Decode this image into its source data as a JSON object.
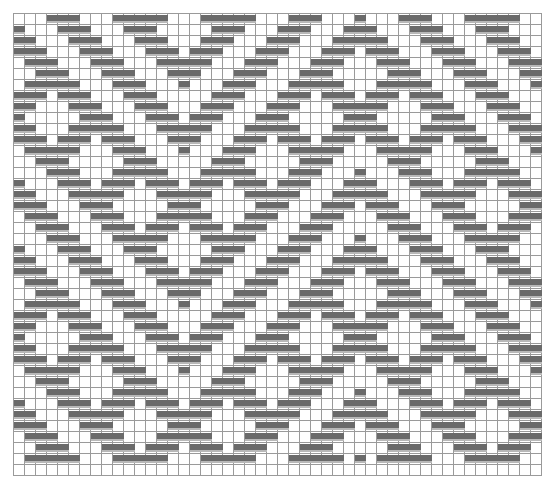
{
  "chart": {
    "type": "weave-pattern-grid",
    "columns": 48,
    "rows": 42,
    "cell_size_px": 11,
    "colors": {
      "filled": "#6a6a6a",
      "empty": "#ffffff",
      "grid_line": "#9a9a9a"
    },
    "filled_runs_by_row": [
      [
        [
          3,
          5
        ],
        [
          9,
          13
        ],
        [
          17,
          21
        ],
        [
          25,
          27
        ],
        [
          31,
          31
        ],
        [
          35,
          37
        ],
        [
          41,
          45
        ]
      ],
      [
        [
          0,
          0
        ],
        [
          4,
          6
        ],
        [
          10,
          12
        ],
        [
          18,
          20
        ],
        [
          24,
          26
        ],
        [
          30,
          32
        ],
        [
          36,
          38
        ],
        [
          42,
          44
        ]
      ],
      [
        [
          0,
          1
        ],
        [
          5,
          7
        ],
        [
          11,
          13
        ],
        [
          17,
          19
        ],
        [
          23,
          25
        ],
        [
          29,
          33
        ],
        [
          37,
          39
        ],
        [
          43,
          45
        ]
      ],
      [
        [
          0,
          2
        ],
        [
          6,
          8
        ],
        [
          12,
          14
        ],
        [
          16,
          18
        ],
        [
          22,
          24
        ],
        [
          28,
          30
        ],
        [
          32,
          34
        ],
        [
          38,
          40
        ],
        [
          44,
          46
        ]
      ],
      [
        [
          1,
          3
        ],
        [
          7,
          9
        ],
        [
          13,
          17
        ],
        [
          21,
          23
        ],
        [
          27,
          29
        ],
        [
          33,
          35
        ],
        [
          39,
          41
        ],
        [
          45,
          47
        ]
      ],
      [
        [
          2,
          4
        ],
        [
          8,
          10
        ],
        [
          14,
          16
        ],
        [
          20,
          22
        ],
        [
          26,
          28
        ],
        [
          34,
          36
        ],
        [
          40,
          42
        ],
        [
          46,
          47
        ]
      ],
      [
        [
          1,
          5
        ],
        [
          9,
          11
        ],
        [
          15,
          15
        ],
        [
          19,
          21
        ],
        [
          25,
          29
        ],
        [
          33,
          37
        ],
        [
          41,
          43
        ],
        [
          47,
          47
        ]
      ],
      [
        [
          0,
          2
        ],
        [
          4,
          6
        ],
        [
          10,
          12
        ],
        [
          18,
          20
        ],
        [
          24,
          26
        ],
        [
          28,
          30
        ],
        [
          32,
          34
        ],
        [
          36,
          38
        ],
        [
          42,
          44
        ]
      ],
      [
        [
          0,
          1
        ],
        [
          5,
          7
        ],
        [
          11,
          13
        ],
        [
          17,
          19
        ],
        [
          23,
          25
        ],
        [
          29,
          33
        ],
        [
          37,
          39
        ],
        [
          43,
          45
        ]
      ],
      [
        [
          0,
          0
        ],
        [
          6,
          8
        ],
        [
          12,
          14
        ],
        [
          16,
          18
        ],
        [
          22,
          24
        ],
        [
          30,
          32
        ],
        [
          38,
          40
        ],
        [
          44,
          46
        ]
      ],
      [
        [
          0,
          1
        ],
        [
          5,
          9
        ],
        [
          13,
          17
        ],
        [
          21,
          25
        ],
        [
          29,
          33
        ],
        [
          37,
          41
        ],
        [
          45,
          47
        ]
      ],
      [
        [
          0,
          2
        ],
        [
          4,
          6
        ],
        [
          8,
          10
        ],
        [
          14,
          16
        ],
        [
          20,
          22
        ],
        [
          24,
          26
        ],
        [
          28,
          30
        ],
        [
          32,
          34
        ],
        [
          36,
          38
        ],
        [
          40,
          42
        ],
        [
          46,
          47
        ]
      ],
      [
        [
          1,
          5
        ],
        [
          9,
          11
        ],
        [
          15,
          15
        ],
        [
          19,
          21
        ],
        [
          25,
          29
        ],
        [
          33,
          37
        ],
        [
          41,
          43
        ],
        [
          47,
          47
        ]
      ],
      [
        [
          2,
          4
        ],
        [
          10,
          12
        ],
        [
          18,
          20
        ],
        [
          26,
          28
        ],
        [
          34,
          36
        ],
        [
          42,
          44
        ]
      ],
      [
        [
          3,
          5
        ],
        [
          9,
          13
        ],
        [
          17,
          21
        ],
        [
          25,
          27
        ],
        [
          31,
          31
        ],
        [
          35,
          37
        ],
        [
          41,
          45
        ]
      ],
      [
        [
          0,
          0
        ],
        [
          4,
          6
        ],
        [
          8,
          10
        ],
        [
          12,
          14
        ],
        [
          16,
          18
        ],
        [
          20,
          22
        ],
        [
          24,
          26
        ],
        [
          30,
          32
        ],
        [
          36,
          38
        ],
        [
          40,
          42
        ],
        [
          44,
          46
        ]
      ],
      [
        [
          0,
          1
        ],
        [
          5,
          9
        ],
        [
          13,
          17
        ],
        [
          21,
          25
        ],
        [
          29,
          33
        ],
        [
          37,
          41
        ],
        [
          45,
          47
        ]
      ],
      [
        [
          0,
          2
        ],
        [
          6,
          8
        ],
        [
          14,
          16
        ],
        [
          22,
          24
        ],
        [
          28,
          30
        ],
        [
          32,
          34
        ],
        [
          38,
          40
        ],
        [
          46,
          47
        ]
      ],
      [
        [
          1,
          3
        ],
        [
          7,
          9
        ],
        [
          13,
          17
        ],
        [
          21,
          23
        ],
        [
          27,
          29
        ],
        [
          33,
          35
        ],
        [
          39,
          41
        ],
        [
          45,
          47
        ]
      ],
      [
        [
          2,
          4
        ],
        [
          8,
          10
        ],
        [
          12,
          14
        ],
        [
          16,
          18
        ],
        [
          20,
          22
        ],
        [
          26,
          28
        ],
        [
          34,
          36
        ],
        [
          40,
          42
        ],
        [
          44,
          46
        ]
      ],
      [
        [
          3,
          5
        ],
        [
          9,
          13
        ],
        [
          17,
          21
        ],
        [
          25,
          27
        ],
        [
          31,
          31
        ],
        [
          35,
          37
        ],
        [
          41,
          45
        ]
      ],
      [
        [
          0,
          0
        ],
        [
          4,
          6
        ],
        [
          10,
          12
        ],
        [
          18,
          20
        ],
        [
          24,
          26
        ],
        [
          30,
          32
        ],
        [
          36,
          38
        ],
        [
          42,
          44
        ]
      ],
      [
        [
          0,
          1
        ],
        [
          5,
          7
        ],
        [
          11,
          13
        ],
        [
          17,
          19
        ],
        [
          23,
          25
        ],
        [
          29,
          33
        ],
        [
          37,
          39
        ],
        [
          43,
          45
        ]
      ],
      [
        [
          0,
          2
        ],
        [
          6,
          8
        ],
        [
          12,
          14
        ],
        [
          16,
          18
        ],
        [
          22,
          24
        ],
        [
          28,
          30
        ],
        [
          32,
          34
        ],
        [
          38,
          40
        ],
        [
          44,
          46
        ]
      ],
      [
        [
          1,
          3
        ],
        [
          7,
          9
        ],
        [
          13,
          17
        ],
        [
          21,
          23
        ],
        [
          27,
          29
        ],
        [
          33,
          35
        ],
        [
          39,
          41
        ],
        [
          45,
          47
        ]
      ],
      [
        [
          2,
          4
        ],
        [
          8,
          10
        ],
        [
          14,
          16
        ],
        [
          20,
          22
        ],
        [
          26,
          28
        ],
        [
          34,
          36
        ],
        [
          40,
          42
        ],
        [
          46,
          47
        ]
      ],
      [
        [
          1,
          5
        ],
        [
          9,
          11
        ],
        [
          15,
          15
        ],
        [
          19,
          21
        ],
        [
          25,
          29
        ],
        [
          33,
          37
        ],
        [
          41,
          43
        ],
        [
          47,
          47
        ]
      ],
      [
        [
          0,
          2
        ],
        [
          4,
          6
        ],
        [
          10,
          12
        ],
        [
          18,
          20
        ],
        [
          24,
          26
        ],
        [
          28,
          30
        ],
        [
          32,
          34
        ],
        [
          36,
          38
        ],
        [
          42,
          44
        ]
      ],
      [
        [
          0,
          1
        ],
        [
          5,
          7
        ],
        [
          11,
          13
        ],
        [
          17,
          19
        ],
        [
          23,
          25
        ],
        [
          29,
          33
        ],
        [
          37,
          39
        ],
        [
          43,
          45
        ]
      ],
      [
        [
          0,
          0
        ],
        [
          6,
          8
        ],
        [
          12,
          14
        ],
        [
          16,
          18
        ],
        [
          22,
          24
        ],
        [
          30,
          32
        ],
        [
          38,
          40
        ],
        [
          44,
          46
        ]
      ],
      [
        [
          0,
          1
        ],
        [
          5,
          9
        ],
        [
          13,
          17
        ],
        [
          21,
          25
        ],
        [
          29,
          33
        ],
        [
          37,
          41
        ],
        [
          45,
          47
        ]
      ],
      [
        [
          0,
          2
        ],
        [
          4,
          6
        ],
        [
          8,
          10
        ],
        [
          14,
          16
        ],
        [
          20,
          22
        ],
        [
          24,
          26
        ],
        [
          28,
          30
        ],
        [
          32,
          34
        ],
        [
          36,
          38
        ],
        [
          40,
          42
        ],
        [
          46,
          47
        ]
      ],
      [
        [
          1,
          5
        ],
        [
          9,
          11
        ],
        [
          15,
          15
        ],
        [
          19,
          21
        ],
        [
          25,
          29
        ],
        [
          33,
          37
        ],
        [
          41,
          43
        ],
        [
          47,
          47
        ]
      ],
      [
        [
          2,
          4
        ],
        [
          10,
          12
        ],
        [
          18,
          20
        ],
        [
          26,
          28
        ],
        [
          34,
          36
        ],
        [
          42,
          44
        ]
      ],
      [
        [
          3,
          5
        ],
        [
          9,
          13
        ],
        [
          17,
          21
        ],
        [
          25,
          27
        ],
        [
          31,
          31
        ],
        [
          35,
          37
        ],
        [
          41,
          45
        ]
      ],
      [
        [
          0,
          0
        ],
        [
          4,
          6
        ],
        [
          8,
          10
        ],
        [
          12,
          14
        ],
        [
          16,
          18
        ],
        [
          20,
          22
        ],
        [
          24,
          26
        ],
        [
          30,
          32
        ],
        [
          36,
          38
        ],
        [
          40,
          42
        ],
        [
          44,
          46
        ]
      ],
      [
        [
          0,
          1
        ],
        [
          5,
          9
        ],
        [
          13,
          17
        ],
        [
          21,
          25
        ],
        [
          29,
          33
        ],
        [
          37,
          41
        ],
        [
          45,
          47
        ]
      ],
      [
        [
          0,
          2
        ],
        [
          6,
          8
        ],
        [
          14,
          16
        ],
        [
          22,
          24
        ],
        [
          28,
          30
        ],
        [
          32,
          34
        ],
        [
          38,
          40
        ],
        [
          46,
          47
        ]
      ],
      [
        [
          1,
          3
        ],
        [
          7,
          9
        ],
        [
          13,
          17
        ],
        [
          21,
          23
        ],
        [
          27,
          29
        ],
        [
          33,
          35
        ],
        [
          39,
          41
        ],
        [
          45,
          47
        ]
      ],
      [
        [
          2,
          4
        ],
        [
          8,
          10
        ],
        [
          12,
          14
        ],
        [
          16,
          18
        ],
        [
          20,
          22
        ],
        [
          26,
          28
        ],
        [
          34,
          36
        ],
        [
          40,
          42
        ],
        [
          44,
          46
        ]
      ],
      [
        [
          1,
          5
        ],
        [
          9,
          13
        ],
        [
          17,
          21
        ],
        [
          25,
          29
        ],
        [
          31,
          31
        ],
        [
          33,
          37
        ],
        [
          41,
          45
        ]
      ],
      []
    ]
  }
}
